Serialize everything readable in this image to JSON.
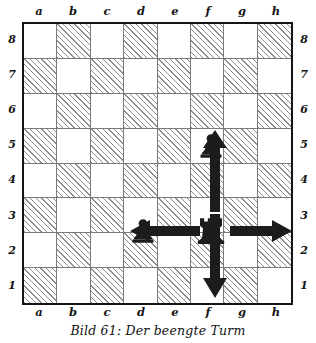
{
  "figure": {
    "caption": "Bild 61: Der beengte Turm",
    "kind": "chess-diagram"
  },
  "board": {
    "files_top": [
      "a",
      "b",
      "c",
      "d",
      "e",
      "f",
      "g",
      "h"
    ],
    "files_bottom": [
      "a",
      "b",
      "c",
      "d",
      "e",
      "f",
      "g",
      "h"
    ],
    "ranks_left": [
      "8",
      "7",
      "6",
      "5",
      "4",
      "3",
      "2",
      "1"
    ],
    "ranks_right": [
      "8",
      "7",
      "6",
      "5",
      "4",
      "3",
      "2",
      "1"
    ],
    "light_color": "#ffffff",
    "dark_color": "#8d8d8d",
    "border_color": "#141414",
    "grid_color": "#7a7a7a"
  },
  "chart_data": {
    "type": "table",
    "title": "Bild 61: Der beengte Turm",
    "xlabel": "",
    "ylabel": "",
    "categories": [
      "a",
      "b",
      "c",
      "d",
      "e",
      "f",
      "g",
      "h"
    ],
    "rows": [
      "8",
      "7",
      "6",
      "5",
      "4",
      "3",
      "2",
      "1"
    ],
    "pieces": [
      {
        "square": "f5",
        "piece": "pawn",
        "color": "black",
        "file": "f",
        "rank": "5"
      },
      {
        "square": "d3",
        "piece": "pawn",
        "color": "black",
        "file": "d",
        "rank": "3"
      },
      {
        "square": "f3",
        "piece": "rook",
        "color": "black",
        "file": "f",
        "rank": "3"
      }
    ],
    "arrows": [
      {
        "name": "arrow-up",
        "from": "f3",
        "to": "f4",
        "direction": "up"
      },
      {
        "name": "arrow-down",
        "from": "f3",
        "to": "f1",
        "direction": "down"
      },
      {
        "name": "arrow-left",
        "from": "f3",
        "to": "e3",
        "direction": "left"
      },
      {
        "name": "arrow-right",
        "from": "f3",
        "to": "h3",
        "direction": "right"
      }
    ],
    "annotations": [
      "Der beengte Turm"
    ]
  }
}
